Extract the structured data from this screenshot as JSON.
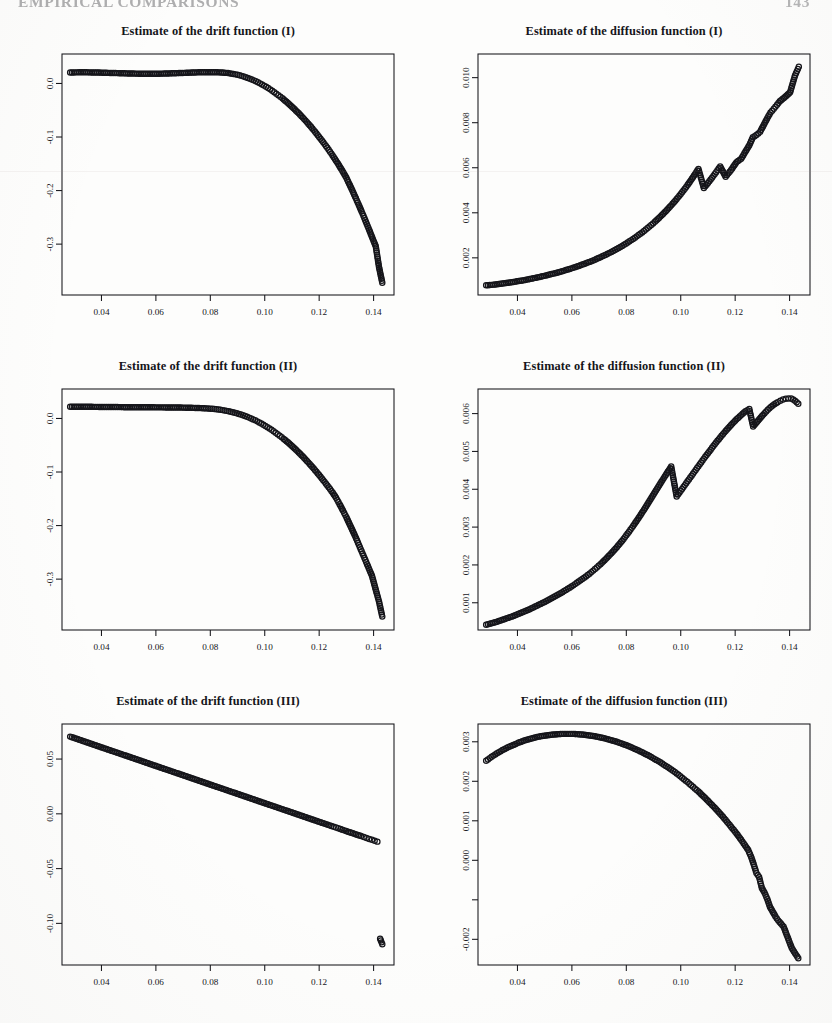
{
  "page": {
    "running_head": "EMPIRICAL COMPARISONS",
    "folio": "143",
    "background_color": "#fdfdfc",
    "ink_color": "#15151a"
  },
  "layout": {
    "columns": 2,
    "rows": 3,
    "panel_width": 416,
    "panel_height": 335
  },
  "axis_style": {
    "tick_label_size": 9.2,
    "y_label_rotation": -90,
    "marker": "open-circle",
    "marker_radius": 2.6,
    "frame": "box"
  },
  "chart_data": [
    {
      "id": "drift-1",
      "type": "scatter",
      "title": "Estimate of the drift function (I)",
      "xlabel": "",
      "ylabel": "",
      "grid": false,
      "legend": null,
      "xlim": [
        0.0255,
        0.1475
      ],
      "ylim": [
        -0.395,
        0.055
      ],
      "xticks": [
        0.04,
        0.06,
        0.08,
        0.1,
        0.12,
        0.14
      ],
      "xticklabels": [
        "0.04",
        "0.06",
        "0.08",
        "0.10",
        "0.12",
        "0.14"
      ],
      "yticks": [
        0.0,
        -0.1,
        -0.2,
        -0.3
      ],
      "yticklabels": [
        "0.0",
        "-0.1",
        "-0.2",
        "-0.3"
      ],
      "x": [
        0.0285,
        0.0305,
        0.0325,
        0.0345,
        0.0365,
        0.0385,
        0.0405,
        0.0425,
        0.0445,
        0.0465,
        0.0485,
        0.0505,
        0.0525,
        0.0545,
        0.0565,
        0.0585,
        0.0605,
        0.0625,
        0.0645,
        0.0665,
        0.0685,
        0.0705,
        0.0725,
        0.0745,
        0.0765,
        0.0785,
        0.0805,
        0.0825,
        0.0845,
        0.0865,
        0.0885,
        0.09,
        0.0915,
        0.093,
        0.0945,
        0.096,
        0.0975,
        0.099,
        0.1005,
        0.102,
        0.1035,
        0.105,
        0.1065,
        0.108,
        0.1095,
        0.111,
        0.1125,
        0.114,
        0.1155,
        0.117,
        0.1185,
        0.12,
        0.1215,
        0.123,
        0.1245,
        0.1258,
        0.127,
        0.1285,
        0.13,
        0.131,
        0.1322,
        0.1335,
        0.1345,
        0.1356,
        0.1366,
        0.1375,
        0.1384,
        0.1392,
        0.14,
        0.1408,
        0.142,
        0.1432
      ],
      "y": [
        0.0205,
        0.0207,
        0.0208,
        0.0208,
        0.0206,
        0.0204,
        0.0201,
        0.0198,
        0.0195,
        0.0192,
        0.0189,
        0.0186,
        0.0184,
        0.0182,
        0.0181,
        0.0181,
        0.0182,
        0.0184,
        0.0187,
        0.019,
        0.0194,
        0.0198,
        0.0202,
        0.0206,
        0.0209,
        0.0211,
        0.0211,
        0.0209,
        0.0204,
        0.0194,
        0.0178,
        0.0162,
        0.0142,
        0.0118,
        0.009,
        0.0058,
        0.0022,
        -0.0018,
        -0.0062,
        -0.011,
        -0.0162,
        -0.0218,
        -0.0278,
        -0.0342,
        -0.041,
        -0.0482,
        -0.0558,
        -0.0638,
        -0.0722,
        -0.081,
        -0.0902,
        -0.0998,
        -0.1098,
        -0.1202,
        -0.131,
        -0.141,
        -0.1505,
        -0.163,
        -0.176,
        -0.187,
        -0.2,
        -0.2145,
        -0.226,
        -0.239,
        -0.251,
        -0.2625,
        -0.2735,
        -0.284,
        -0.294,
        -0.304,
        -0.343,
        -0.372
      ]
    },
    {
      "id": "diffusion-1",
      "type": "scatter",
      "title": "Estimate of the diffusion function (I)",
      "xlabel": "",
      "ylabel": "",
      "grid": false,
      "legend": null,
      "xlim": [
        0.0255,
        0.1475
      ],
      "ylim": [
        0.00035,
        0.01105
      ],
      "xticks": [
        0.04,
        0.06,
        0.08,
        0.1,
        0.12,
        0.14
      ],
      "xticklabels": [
        "0.04",
        "0.06",
        "0.08",
        "0.10",
        "0.12",
        "0.14"
      ],
      "yticks": [
        0.002,
        0.004,
        0.006,
        0.008,
        0.01
      ],
      "yticklabels": [
        "0.002",
        "0.004",
        "0.006",
        "0.008",
        "0.010"
      ],
      "x": [
        0.0285,
        0.0305,
        0.0325,
        0.0345,
        0.0365,
        0.0385,
        0.0405,
        0.0425,
        0.0445,
        0.0465,
        0.0485,
        0.0505,
        0.0525,
        0.0545,
        0.0565,
        0.0585,
        0.0605,
        0.0625,
        0.0645,
        0.0665,
        0.0685,
        0.0705,
        0.0725,
        0.0745,
        0.0765,
        0.0785,
        0.0805,
        0.0825,
        0.0845,
        0.0865,
        0.0885,
        0.0905,
        0.0925,
        0.0945,
        0.0965,
        0.0985,
        0.1005,
        0.1025,
        0.1045,
        0.1065,
        0.1085,
        0.1105,
        0.1125,
        0.1145,
        0.1165,
        0.1185,
        0.1205,
        0.1222,
        0.1238,
        0.1252,
        0.1265,
        0.1278,
        0.1292,
        0.1305,
        0.1318,
        0.133,
        0.1342,
        0.1354,
        0.1364,
        0.1374,
        0.1384,
        0.1393,
        0.1402,
        0.142,
        0.1434
      ],
      "y": [
        0.00078,
        0.0008,
        0.00083,
        0.00086,
        0.00089,
        0.00093,
        0.00097,
        0.00101,
        0.00106,
        0.00111,
        0.00116,
        0.00122,
        0.00128,
        0.00134,
        0.00141,
        0.00148,
        0.00156,
        0.00164,
        0.00173,
        0.00182,
        0.00192,
        0.00203,
        0.00214,
        0.00226,
        0.00239,
        0.00253,
        0.00268,
        0.00284,
        0.00301,
        0.00319,
        0.00339,
        0.0036,
        0.00383,
        0.00407,
        0.00433,
        0.00461,
        0.00491,
        0.00523,
        0.00558,
        0.00595,
        0.0051,
        0.0054,
        0.00572,
        0.00606,
        0.0056,
        0.0059,
        0.00625,
        0.0064,
        0.00672,
        0.007,
        0.00735,
        0.00745,
        0.0076,
        0.0079,
        0.0082,
        0.00845,
        0.00862,
        0.0088,
        0.00895,
        0.00905,
        0.00915,
        0.00925,
        0.00935,
        0.0101,
        0.01048
      ]
    },
    {
      "id": "drift-2",
      "type": "scatter",
      "title": "Estimate of the drift function (II)",
      "xlabel": "",
      "ylabel": "",
      "grid": false,
      "legend": null,
      "xlim": [
        0.0255,
        0.1475
      ],
      "ylim": [
        -0.395,
        0.055
      ],
      "xticks": [
        0.04,
        0.06,
        0.08,
        0.1,
        0.12,
        0.14
      ],
      "xticklabels": [
        "0.04",
        "0.06",
        "0.08",
        "0.10",
        "0.12",
        "0.14"
      ],
      "yticks": [
        0.0,
        -0.1,
        -0.2,
        -0.3
      ],
      "yticklabels": [
        "0.0",
        "-0.1",
        "-0.2",
        "-0.3"
      ],
      "x": [
        0.0285,
        0.0305,
        0.0325,
        0.0345,
        0.0365,
        0.0385,
        0.0405,
        0.0425,
        0.0445,
        0.0465,
        0.0485,
        0.0505,
        0.0525,
        0.0545,
        0.0565,
        0.0585,
        0.0605,
        0.0625,
        0.0645,
        0.0665,
        0.0685,
        0.0705,
        0.0725,
        0.0745,
        0.0765,
        0.0785,
        0.08,
        0.0815,
        0.083,
        0.0845,
        0.086,
        0.0875,
        0.089,
        0.0905,
        0.092,
        0.0935,
        0.095,
        0.0965,
        0.098,
        0.0995,
        0.101,
        0.1025,
        0.104,
        0.1055,
        0.107,
        0.1085,
        0.11,
        0.1115,
        0.113,
        0.1145,
        0.116,
        0.1175,
        0.119,
        0.1205,
        0.122,
        0.1235,
        0.125,
        0.1262,
        0.1275,
        0.1288,
        0.13,
        0.1312,
        0.1324,
        0.1336,
        0.1346,
        0.1356,
        0.1366,
        0.1376,
        0.1385,
        0.1394,
        0.142,
        0.1432
      ],
      "y": [
        0.0218,
        0.0219,
        0.0219,
        0.0218,
        0.0217,
        0.0216,
        0.0215,
        0.0214,
        0.0213,
        0.0212,
        0.0211,
        0.021,
        0.0209,
        0.0209,
        0.0208,
        0.0208,
        0.0207,
        0.0207,
        0.0206,
        0.0205,
        0.0204,
        0.0202,
        0.02,
        0.0197,
        0.0193,
        0.0188,
        0.0183,
        0.0176,
        0.0167,
        0.0156,
        0.0142,
        0.0126,
        0.0107,
        0.0085,
        0.006,
        0.0032,
        0.0,
        -0.0035,
        -0.0074,
        -0.0116,
        -0.0162,
        -0.0212,
        -0.0265,
        -0.0322,
        -0.0382,
        -0.0446,
        -0.0514,
        -0.0585,
        -0.066,
        -0.0738,
        -0.082,
        -0.0906,
        -0.0995,
        -0.1088,
        -0.1184,
        -0.1284,
        -0.1388,
        -0.148,
        -0.16,
        -0.1725,
        -0.1845,
        -0.1975,
        -0.2105,
        -0.224,
        -0.236,
        -0.248,
        -0.26,
        -0.272,
        -0.283,
        -0.2935,
        -0.342,
        -0.37
      ]
    },
    {
      "id": "diffusion-2",
      "type": "scatter",
      "title": "Estimate of the diffusion function (II)",
      "xlabel": "",
      "ylabel": "",
      "grid": false,
      "legend": null,
      "xlim": [
        0.0255,
        0.1475
      ],
      "ylim": [
        0.00028,
        0.00665
      ],
      "xticks": [
        0.04,
        0.06,
        0.08,
        0.1,
        0.12,
        0.14
      ],
      "xticklabels": [
        "0.04",
        "0.06",
        "0.08",
        "0.10",
        "0.12",
        "0.14"
      ],
      "yticks": [
        0.001,
        0.002,
        0.003,
        0.004,
        0.005,
        0.006
      ],
      "yticklabels": [
        "0.001",
        "0.002",
        "0.003",
        "0.004",
        "0.005",
        "0.006"
      ],
      "x": [
        0.0285,
        0.0305,
        0.0325,
        0.0345,
        0.0365,
        0.0385,
        0.0405,
        0.0425,
        0.0445,
        0.0465,
        0.0485,
        0.0505,
        0.0525,
        0.0545,
        0.0565,
        0.0585,
        0.0605,
        0.0625,
        0.0645,
        0.0665,
        0.0685,
        0.0705,
        0.0725,
        0.0745,
        0.0765,
        0.0785,
        0.0805,
        0.0825,
        0.0845,
        0.0865,
        0.0885,
        0.0905,
        0.0925,
        0.0945,
        0.0965,
        0.0985,
        0.1005,
        0.1025,
        0.1045,
        0.1065,
        0.1085,
        0.1105,
        0.1125,
        0.1145,
        0.1165,
        0.1185,
        0.1205,
        0.1222,
        0.1238,
        0.1252,
        0.1266,
        0.128,
        0.1294,
        0.1308,
        0.132,
        0.1332,
        0.1344,
        0.1356,
        0.1366,
        0.1376,
        0.1386,
        0.1396,
        0.1406,
        0.142,
        0.1432
      ],
      "y": [
        0.00042,
        0.00046,
        0.0005,
        0.00055,
        0.0006,
        0.00065,
        0.00071,
        0.00077,
        0.00083,
        0.0009,
        0.00097,
        0.00104,
        0.00112,
        0.0012,
        0.00128,
        0.00137,
        0.00146,
        0.00156,
        0.00166,
        0.00177,
        0.00189,
        0.00202,
        0.00216,
        0.00231,
        0.00247,
        0.00264,
        0.00283,
        0.00303,
        0.00324,
        0.00346,
        0.00369,
        0.00392,
        0.00415,
        0.00438,
        0.0046,
        0.00381,
        0.00401,
        0.00421,
        0.00441,
        0.00461,
        0.00481,
        0.005,
        0.00519,
        0.00537,
        0.00554,
        0.0057,
        0.00585,
        0.00596,
        0.00606,
        0.00612,
        0.00566,
        0.00578,
        0.0059,
        0.00601,
        0.0061,
        0.00618,
        0.00625,
        0.0063,
        0.00634,
        0.00637,
        0.00639,
        0.0064,
        0.0064,
        0.00634,
        0.00626
      ]
    },
    {
      "id": "drift-3",
      "type": "scatter",
      "title": "Estimate of the drift function (III)",
      "xlabel": "",
      "ylabel": "",
      "grid": false,
      "legend": null,
      "xlim": [
        0.0255,
        0.1475
      ],
      "ylim": [
        -0.138,
        0.082
      ],
      "xticks": [
        0.04,
        0.06,
        0.08,
        0.1,
        0.12,
        0.14
      ],
      "xticklabels": [
        "0.04",
        "0.06",
        "0.08",
        "0.10",
        "0.12",
        "0.14"
      ],
      "yticks": [
        0.05,
        0.0,
        -0.05,
        -0.1
      ],
      "yticklabels": [
        "0.05",
        "0.00",
        "-0.05",
        "-0.10"
      ],
      "x": [
        0.0285,
        0.0305,
        0.0325,
        0.0345,
        0.0365,
        0.0385,
        0.0405,
        0.0425,
        0.0445,
        0.0465,
        0.0485,
        0.0505,
        0.0525,
        0.0545,
        0.0565,
        0.0585,
        0.0605,
        0.0625,
        0.0645,
        0.0665,
        0.0685,
        0.0705,
        0.0725,
        0.0745,
        0.0765,
        0.0785,
        0.0805,
        0.0825,
        0.0845,
        0.0865,
        0.0885,
        0.0905,
        0.0925,
        0.0945,
        0.0965,
        0.0985,
        0.1005,
        0.1025,
        0.1045,
        0.1065,
        0.1085,
        0.1105,
        0.1125,
        0.1145,
        0.1165,
        0.1185,
        0.1205,
        0.1225,
        0.1245,
        0.1262,
        0.1278,
        0.1292,
        0.1306,
        0.1318,
        0.133,
        0.1342,
        0.1354,
        0.1364,
        0.1374,
        0.1384,
        0.1394,
        0.1404,
        0.1414,
        0.1424,
        0.1432
      ],
      "y": [
        0.0705,
        0.0688,
        0.0671,
        0.0654,
        0.0637,
        0.062,
        0.0603,
        0.0586,
        0.0569,
        0.0552,
        0.0535,
        0.0518,
        0.0501,
        0.0484,
        0.0467,
        0.045,
        0.0433,
        0.0416,
        0.0399,
        0.0382,
        0.0365,
        0.0348,
        0.0331,
        0.0314,
        0.0297,
        0.028,
        0.0263,
        0.0246,
        0.0229,
        0.0212,
        0.0195,
        0.0178,
        0.0161,
        0.0144,
        0.0127,
        0.011,
        0.0093,
        0.0076,
        0.0059,
        0.0042,
        0.0025,
        0.0008,
        -0.0009,
        -0.0026,
        -0.0043,
        -0.006,
        -0.0077,
        -0.0094,
        -0.0111,
        -0.0125,
        -0.0139,
        -0.0151,
        -0.0163,
        -0.0173,
        -0.0183,
        -0.0193,
        -0.0203,
        -0.0212,
        -0.022,
        -0.0229,
        -0.0237,
        -0.0246,
        -0.0254,
        -0.114,
        -0.119
      ]
    },
    {
      "id": "diffusion-3",
      "type": "scatter",
      "title": "Estimate of the diffusion function (III)",
      "xlabel": "",
      "ylabel": "",
      "grid": false,
      "legend": null,
      "xlim": [
        0.0255,
        0.1475
      ],
      "ylim": [
        -0.00265,
        0.00345
      ],
      "xticks": [
        0.04,
        0.06,
        0.08,
        0.1,
        0.12,
        0.14
      ],
      "xticklabels": [
        "0.04",
        "0.06",
        "0.08",
        "0.10",
        "0.12",
        "0.14"
      ],
      "yticks": [
        0.003,
        0.002,
        0.001,
        0.0,
        -0.001,
        -0.002
      ],
      "yticklabels": [
        "0.003",
        "0.002",
        "0.001",
        "0.000",
        "",
        "-0.002"
      ],
      "x": [
        0.0285,
        0.0305,
        0.0325,
        0.0345,
        0.0365,
        0.0385,
        0.0405,
        0.0425,
        0.0445,
        0.0465,
        0.0485,
        0.0505,
        0.0525,
        0.0545,
        0.0565,
        0.0585,
        0.0605,
        0.0625,
        0.0645,
        0.0665,
        0.0685,
        0.0705,
        0.0725,
        0.0745,
        0.0765,
        0.0785,
        0.0805,
        0.0825,
        0.0845,
        0.0865,
        0.0885,
        0.0905,
        0.0925,
        0.0945,
        0.0965,
        0.0985,
        0.1005,
        0.1025,
        0.1045,
        0.1065,
        0.1085,
        0.1105,
        0.1125,
        0.1145,
        0.1165,
        0.1185,
        0.1205,
        0.1222,
        0.1236,
        0.1248,
        0.1258,
        0.1268,
        0.1278,
        0.1288,
        0.1298,
        0.1308,
        0.1318,
        0.1328,
        0.1338,
        0.1348,
        0.1358,
        0.1368,
        0.1378,
        0.1408,
        0.1432
      ],
      "y": [
        0.00252,
        0.00262,
        0.00271,
        0.00279,
        0.00286,
        0.00292,
        0.00298,
        0.00303,
        0.00307,
        0.00311,
        0.00314,
        0.00316,
        0.00318,
        0.00319,
        0.0032,
        0.0032,
        0.0032,
        0.00319,
        0.00318,
        0.00316,
        0.00314,
        0.00311,
        0.00308,
        0.00304,
        0.003,
        0.00295,
        0.0029,
        0.00284,
        0.00278,
        0.00271,
        0.00264,
        0.00256,
        0.00248,
        0.00239,
        0.0023,
        0.0022,
        0.00209,
        0.00198,
        0.00186,
        0.00174,
        0.00161,
        0.00147,
        0.00133,
        0.00118,
        0.00102,
        0.00085,
        0.00068,
        0.00052,
        0.00038,
        0.00026,
        0.0001,
        -0.0001,
        -0.00032,
        -0.00042,
        -0.0007,
        -0.00082,
        -0.00098,
        -0.00118,
        -0.0013,
        -0.00142,
        -0.00152,
        -0.0016,
        -0.00168,
        -0.00222,
        -0.00248
      ]
    }
  ]
}
